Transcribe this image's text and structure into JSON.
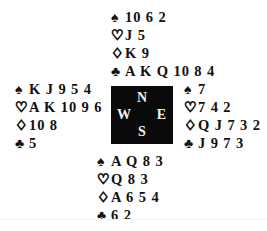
{
  "diagram": {
    "type": "bridge-deal-diagram",
    "suit_glyphs": {
      "spade": "♠",
      "heart": "♡",
      "diamond": "♢",
      "club": "♣"
    },
    "colors": {
      "ink": "#111111",
      "compass_background": "#0a0a0a",
      "compass_text": "#f2f0ec",
      "page_background": "#ffffff"
    }
  },
  "compass": {
    "north": "N",
    "west": "W",
    "east": "E",
    "south": "S"
  },
  "hands": {
    "north": {
      "position": "North",
      "spades": "10 6 2",
      "hearts": "J 5",
      "diamonds": "K 9",
      "clubs": "A K Q 10 8 4"
    },
    "west": {
      "position": "West",
      "spades": "K J 9 5 4",
      "hearts": "A K 10 9 6",
      "diamonds": "10 8",
      "clubs": "5"
    },
    "east": {
      "position": "East",
      "spades": "7",
      "hearts": "7 4 2",
      "diamonds": "Q J 7 3 2",
      "clubs": "J 9 7 3"
    },
    "south": {
      "position": "South",
      "spades": "A Q 8 3",
      "hearts": "Q 8 3",
      "diamonds": "A 6 5 4",
      "clubs": "6 2"
    }
  }
}
